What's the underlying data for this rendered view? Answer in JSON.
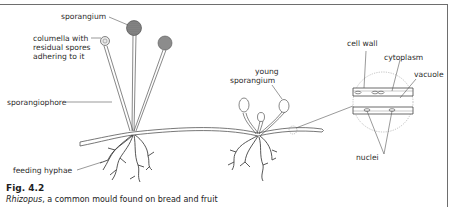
{
  "figure": {
    "number": "Fig. 4.2",
    "caption_italic": "Rhizopus",
    "caption_rest": ", a common mould found on bread and fruit"
  },
  "labels": {
    "sporangium": "sporangium",
    "columella_line1": "columella with",
    "columella_line2": "residual spores",
    "columella_line3": "adhering to it",
    "sporangiophore": "sporangiophore",
    "feeding_hyphae": "feeding hyphae",
    "young_sporangium_line1": "young",
    "young_sporangium_line2": "sporangium",
    "cell_wall": "cell wall",
    "cytoplasm": "cytoplasm",
    "vacuole": "vacuole",
    "nuclei": "nuclei"
  },
  "colors": {
    "line": "#555555",
    "sporangium_fill": "#7a7a7a",
    "frame": "#6e6e6e"
  }
}
